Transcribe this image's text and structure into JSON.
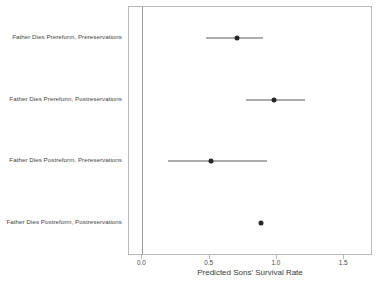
{
  "chart_data": {
    "type": "scatter",
    "title": "",
    "xlabel": "Predicted Sons' Survival Rate",
    "ylabel": "",
    "xlim": [
      -0.1,
      1.7
    ],
    "xticks": [
      0.0,
      0.5,
      1.0,
      1.5
    ],
    "xticklabels": [
      "0.0",
      "0.5",
      "1.0",
      "1.5"
    ],
    "grid": false,
    "legend": null,
    "reference_line_x": 0.0,
    "categories": [
      "Father Dies Prereform, Prereservations",
      "Father Dies Prereform, Postreservations",
      "Father Dies Postreform, Prereservations",
      "Father Dies Postreform, Postreservations"
    ],
    "values": [
      0.7,
      0.98,
      0.51,
      0.88
    ],
    "ci_low": [
      0.47,
      0.77,
      0.19,
      null
    ],
    "ci_high": [
      0.9,
      1.21,
      0.93,
      null
    ],
    "points": [
      {
        "label": "Father Dies Prereform, Prereservations",
        "estimate": 0.7,
        "ci_low": 0.47,
        "ci_high": 0.9
      },
      {
        "label": "Father Dies Prereform, Postreservations",
        "estimate": 0.98,
        "ci_low": 0.77,
        "ci_high": 1.21
      },
      {
        "label": "Father Dies Postreform, Prereservations",
        "estimate": 0.51,
        "ci_low": 0.19,
        "ci_high": 0.93
      },
      {
        "label": "Father Dies Postreform, Postreservations",
        "estimate": 0.88,
        "ci_low": null,
        "ci_high": null
      }
    ],
    "colors": {
      "marker": "#262626",
      "interval": "#5a5a5a",
      "frame": "#b9b9b9",
      "reference_line": "#9a9a9a",
      "background": "#ffffff",
      "text": "#3a3a3a"
    }
  }
}
